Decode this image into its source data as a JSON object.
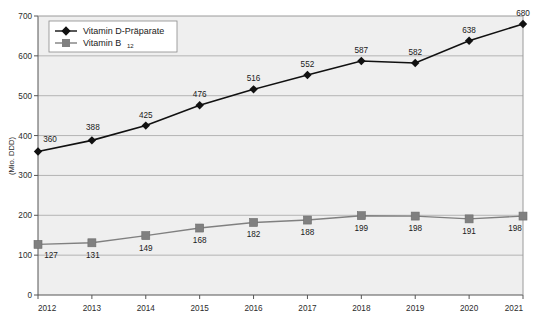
{
  "chart_data": {
    "type": "line",
    "title": "",
    "subtitle": "",
    "xlabel": "",
    "ylabel": "(Mio. DDD)",
    "categories": [
      "2012",
      "2013",
      "2014",
      "2015",
      "2016",
      "2017",
      "2018",
      "2019",
      "2020",
      "2021"
    ],
    "x": [
      2012,
      2013,
      2014,
      2015,
      2016,
      2017,
      2018,
      2019,
      2020,
      2021
    ],
    "ylim": [
      0,
      700
    ],
    "xlim": [
      2012,
      2021
    ],
    "y_ticks": [
      0,
      100,
      200,
      300,
      400,
      500,
      600,
      700
    ],
    "y_tick_labels": [
      "0",
      "100",
      "200",
      "300",
      "400",
      "500",
      "600",
      "700"
    ],
    "grid": "horizontal",
    "legend_position": "top-left-inside",
    "plot_background": "#efefef",
    "grid_color": "#9a9a9a",
    "axis_color": "#555555",
    "series": [
      {
        "name": "Vitamin D-Präparate",
        "color": "#111111",
        "marker": "diamond",
        "label_position": "above",
        "values": [
          360,
          388,
          425,
          476,
          516,
          552,
          587,
          582,
          638,
          680
        ],
        "value_labels": [
          "360",
          "388",
          "425",
          "476",
          "516",
          "552",
          "587",
          "582",
          "638",
          "680"
        ]
      },
      {
        "name": "Vitamin B12",
        "name_base": "Vitamin B",
        "name_subscript": "12",
        "color": "#808080",
        "marker": "square",
        "label_position": "below",
        "values": [
          127,
          131,
          149,
          168,
          182,
          188,
          199,
          198,
          191,
          198
        ],
        "value_labels": [
          "127",
          "131",
          "149",
          "168",
          "182",
          "188",
          "199",
          "198",
          "191",
          "198"
        ]
      }
    ]
  },
  "legend": {
    "items": [
      {
        "label": "Vitamin D-Präparate",
        "marker": "diamond-marker",
        "color": "#111111"
      },
      {
        "label_base": "Vitamin B",
        "label_sub": "12",
        "marker": "square-marker",
        "color": "#808080"
      }
    ]
  }
}
